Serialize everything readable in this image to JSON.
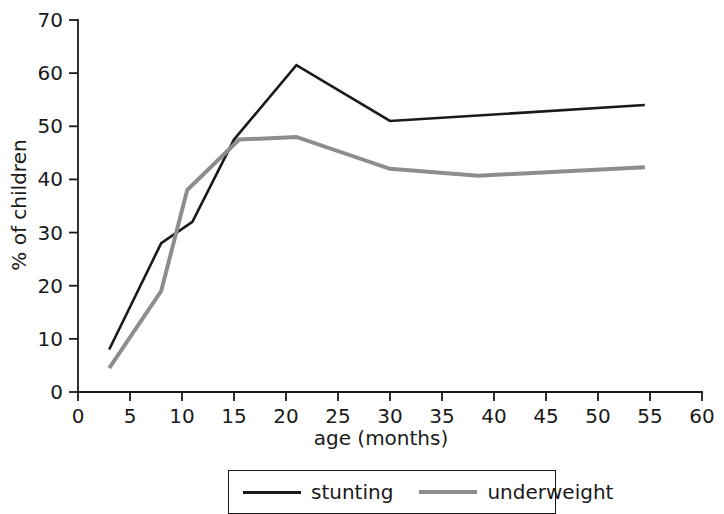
{
  "chart_data": {
    "type": "line",
    "title": "",
    "xlabel": "age (months)",
    "ylabel": "% of children",
    "xlim": [
      0,
      60
    ],
    "ylim": [
      0,
      70
    ],
    "xticks": [
      0,
      5,
      10,
      15,
      20,
      25,
      30,
      35,
      40,
      45,
      50,
      55,
      60
    ],
    "yticks": [
      0,
      10,
      20,
      30,
      40,
      50,
      60,
      70
    ],
    "grid": false,
    "legend_position": "bottom",
    "series": [
      {
        "name": "stunting",
        "color": "#1a1a1a",
        "width": 2.6,
        "points": [
          [
            3,
            8
          ],
          [
            8,
            28
          ],
          [
            11,
            32
          ],
          [
            15,
            47.5
          ],
          [
            21,
            61.5
          ],
          [
            30,
            51
          ],
          [
            54.5,
            54
          ]
        ]
      },
      {
        "name": "underweight",
        "color": "#8d8d8d",
        "width": 4.0,
        "points": [
          [
            3,
            4.5
          ],
          [
            8,
            19
          ],
          [
            10.5,
            38
          ],
          [
            15.5,
            47.5
          ],
          [
            21,
            48
          ],
          [
            30,
            42
          ],
          [
            38.5,
            40.7
          ],
          [
            54.5,
            42.3
          ]
        ]
      }
    ]
  },
  "axes": {
    "x_label": "age (months)",
    "y_label": "% of children",
    "x_tick_labels": [
      "0",
      "5",
      "10",
      "15",
      "20",
      "25",
      "30",
      "35",
      "40",
      "45",
      "50",
      "55",
      "60"
    ],
    "y_tick_labels": [
      "0",
      "10",
      "20",
      "30",
      "40",
      "50",
      "60",
      "70"
    ]
  },
  "legend": {
    "items": [
      {
        "label": "stunting",
        "color": "#1a1a1a"
      },
      {
        "label": "underweight",
        "color": "#8d8d8d"
      }
    ]
  }
}
